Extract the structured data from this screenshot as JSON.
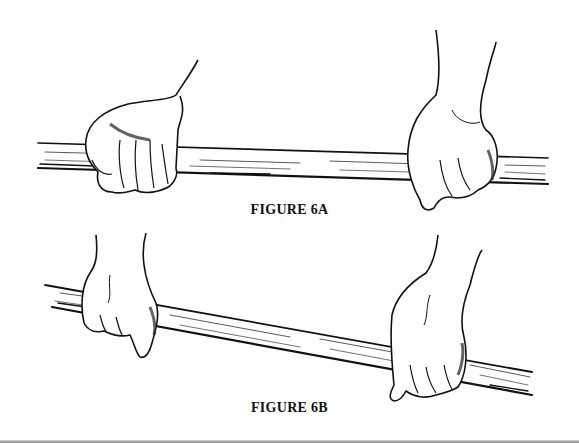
{
  "figures": [
    {
      "id": "6A",
      "caption": "FIGURE 6A",
      "description": "Two hands gripping a horizontal wooden stick; left hand in overhand grip, right hand in grip from above",
      "stick": {
        "x1": 38,
        "y1": 150,
        "x2": 548,
        "y2": 168
      }
    },
    {
      "id": "6B",
      "caption": "FIGURE 6B",
      "description": "Two hands gripping a slanted wooden stick; left hand high on the stick, right hand lower",
      "stick": {
        "x1": 45,
        "y1": 292,
        "x2": 532,
        "y2": 390
      }
    }
  ],
  "colors": {
    "ink": "#111111",
    "paper": "#ffffff"
  }
}
